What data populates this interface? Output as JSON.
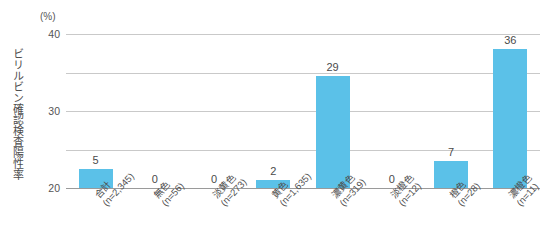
{
  "chart_data": {
    "type": "bar",
    "title": "",
    "subtitle": "",
    "xlabel": "",
    "ylabel": "ビリルビン確認検査陽性率",
    "unit_label": "(%)",
    "ylim": [
      0,
      40
    ],
    "yticks": [
      40,
      30,
      20,
      10,
      0
    ],
    "grid": true,
    "legend": "none",
    "bar_color": "#5bc1e8",
    "gridline_color": "#c9c9c9",
    "axis_color": "#9a9a9a",
    "text_color": "#4a4a4a",
    "categories": [
      "合計\n(n=2,345)",
      "無色\n(n=56)",
      "淡黄色\n(n=273)",
      "黄色\n(n=1,635)",
      "濃黄色\n(n=319)",
      "淡橙色\n(n=12)",
      "橙色\n(n=28)",
      "濃橙色\n(n=11)"
    ],
    "category_names": [
      "合計",
      "無色",
      "淡黄色",
      "黄色",
      "濃黄色",
      "淡橙色",
      "橙色",
      "濃橙色"
    ],
    "category_counts": [
      "(n=2,345)",
      "(n=56)",
      "(n=273)",
      "(n=1,635)",
      "(n=319)",
      "(n=12)",
      "(n=28)",
      "(n=11)"
    ],
    "values": [
      5,
      0,
      0,
      2,
      29,
      0,
      7,
      36
    ],
    "value_labels": [
      "5",
      "0",
      "0",
      "2",
      "29",
      "0",
      "7",
      "36"
    ]
  }
}
